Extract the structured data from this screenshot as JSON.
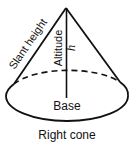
{
  "diagram": {
    "title": "Right cone",
    "labels": {
      "slant_height": "Slant height",
      "altitude": "Altitude",
      "h": "h",
      "base": "Base"
    },
    "colors": {
      "stroke": "#111111",
      "background": "#ffffff"
    }
  }
}
